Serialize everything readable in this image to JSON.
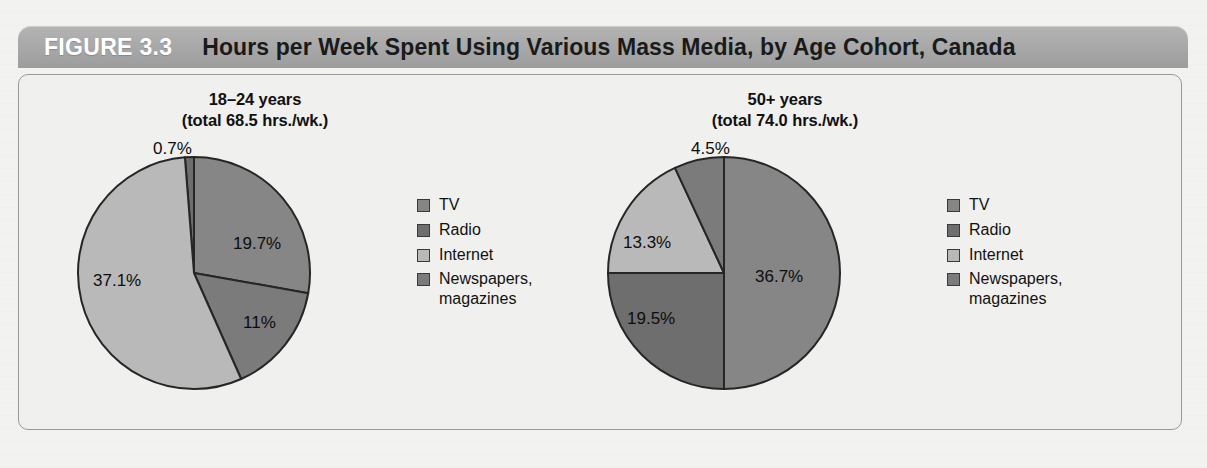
{
  "figure": {
    "number_label": "FIGURE 3.3",
    "title": "Hours per Week Spent Using Various Mass Media, by Age Cohort, Canada"
  },
  "palette": {
    "tv": "#868686",
    "radio": "#6e6e6e",
    "internet": "#b9b9b9",
    "newspapers": "#7b7b7b",
    "outline": "#262626",
    "header_bar": "#a9a9a9",
    "panel_bg": "#f0f0ee",
    "panel_border": "#9a9a9a"
  },
  "legend": {
    "items": [
      {
        "label": "TV",
        "color_key": "tv"
      },
      {
        "label": "Radio",
        "color_key": "radio"
      },
      {
        "label": "Internet",
        "color_key": "internet"
      },
      {
        "label": "Newspapers,\nmagazines",
        "color_key": "newspapers"
      }
    ]
  },
  "chart_data": [
    {
      "type": "pie",
      "id": "cohort-18-24",
      "title": "18–24 years\n(total 68.5 hrs./wk.)",
      "cohort": "18–24 years",
      "total_hours_per_week": 68.5,
      "total_label": "(total 68.5 hrs./wk.)",
      "categories": [
        "TV",
        "Radio",
        "Internet",
        "Newspapers, magazines"
      ],
      "values": [
        19.7,
        0.7,
        37.1,
        11.0
      ],
      "value_labels": [
        "19.7%",
        "0.7%",
        "37.1%",
        "11%"
      ],
      "slices": [
        {
          "name": "Radio",
          "value": 0.7,
          "label": "0.7%",
          "color_key": "radio",
          "start_deg": 355.5,
          "end_deg": 360.0,
          "label_kind": "callout",
          "label_x": 96,
          "label_y": 2,
          "leader": {
            "x1": 138,
            "y1": 26,
            "x2": 142,
            "y2": 52
          }
        },
        {
          "name": "TV",
          "value": 19.7,
          "label": "19.7%",
          "color_key": "tv",
          "start_deg": 0.0,
          "end_deg": 100.0,
          "label_kind": "inside",
          "label_x": 176,
          "label_y": 97
        },
        {
          "name": "Newspapers, magazines",
          "value": 11.0,
          "label": "11%",
          "color_key": "newspapers",
          "start_deg": 100.0,
          "end_deg": 156.0,
          "label_kind": "inside",
          "label_x": 186,
          "label_y": 176
        },
        {
          "name": "Internet",
          "value": 37.1,
          "label": "37.1%",
          "color_key": "internet",
          "start_deg": 156.0,
          "end_deg": 355.5,
          "label_kind": "inside",
          "label_x": 36,
          "label_y": 134
        }
      ],
      "legend_position": "right"
    },
    {
      "type": "pie",
      "id": "cohort-50-plus",
      "title": "50+ years\n(total 74.0 hrs./wk.)",
      "cohort": "50+ years",
      "total_hours_per_week": 74.0,
      "total_label": "(total 74.0 hrs./wk.)",
      "categories": [
        "TV",
        "Radio",
        "Internet",
        "Newspapers, magazines"
      ],
      "values": [
        36.7,
        19.5,
        13.3,
        4.5
      ],
      "value_labels": [
        "36.7%",
        "19.5%",
        "13.3%",
        "4.5%"
      ],
      "slices": [
        {
          "name": "TV",
          "value": 36.7,
          "label": "36.7%",
          "color_key": "tv",
          "start_deg": 0.0,
          "end_deg": 180.0,
          "label_kind": "inside",
          "label_x": 168,
          "label_y": 130
        },
        {
          "name": "Radio",
          "value": 19.5,
          "label": "19.5%",
          "color_key": "radio",
          "start_deg": 180.0,
          "end_deg": 270.0,
          "label_kind": "inside",
          "label_x": 40,
          "label_y": 172
        },
        {
          "name": "Internet",
          "value": 13.3,
          "label": "13.3%",
          "color_key": "internet",
          "start_deg": 270.0,
          "end_deg": 335.0,
          "label_kind": "inside",
          "label_x": 36,
          "label_y": 96
        },
        {
          "name": "Newspapers, magazines",
          "value": 4.5,
          "label": "4.5%",
          "color_key": "newspapers",
          "start_deg": 335.0,
          "end_deg": 360.0,
          "label_kind": "callout",
          "label_x": 104,
          "label_y": 2,
          "leader": null
        }
      ],
      "legend_position": "right"
    }
  ]
}
